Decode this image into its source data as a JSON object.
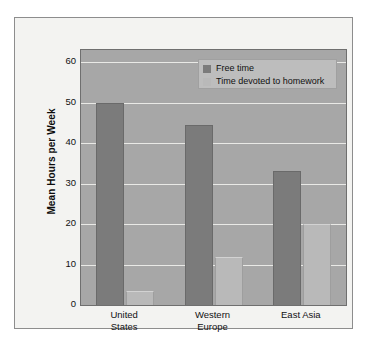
{
  "chart_data": {
    "type": "bar",
    "title": "",
    "xlabel": "",
    "ylabel": "Mean Hours per Week",
    "categories": [
      "United States",
      "Western Europe",
      "East Asia"
    ],
    "category_lines": [
      [
        "United",
        "States"
      ],
      [
        "Western",
        "Europe"
      ],
      [
        "East Asia"
      ]
    ],
    "series": [
      {
        "name": "Free time",
        "values": [
          50,
          44.5,
          33
        ],
        "color": "#7b7b7b"
      },
      {
        "name": "Time devoted to homework",
        "values": [
          3.5,
          11.8,
          20
        ],
        "color": "#b9b9b9"
      }
    ],
    "ylim": [
      0,
      63
    ],
    "yticks": [
      0,
      10,
      20,
      30,
      40,
      50,
      60
    ],
    "ytick_labels": [
      "0",
      "10",
      "20",
      "30",
      "40",
      "50",
      "60"
    ],
    "grid": true,
    "legend_position": "top-right",
    "plot_background": "#a7a7a7",
    "figure_background": "#f3f3f1",
    "gridline_color": "#e9e9e6"
  }
}
